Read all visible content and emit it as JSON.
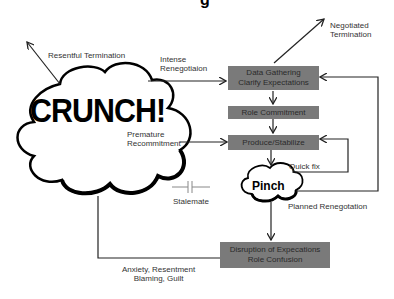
{
  "title_fragment": "g",
  "cloud_labels": {
    "crunch": "CRUNCH!",
    "pinch": "Pinch"
  },
  "boxes": [
    {
      "id": "data-gathering",
      "lines": [
        "Data Gathering",
        "Clarify Expectations"
      ]
    },
    {
      "id": "role-commitment",
      "lines": [
        "Role Commitment"
      ]
    },
    {
      "id": "produce-stabilize",
      "lines": [
        "Produce/Stabilize"
      ]
    },
    {
      "id": "disruption",
      "lines": [
        "Disruption of Expecations",
        "Role Confusion"
      ]
    }
  ],
  "edge_labels": {
    "resentful_termination": "Resentful Termination",
    "intense_renegotiation": [
      "Intense",
      "Renegotiaion"
    ],
    "negotiated_termination": [
      "Negotiated",
      "Termination"
    ],
    "premature_recommitment": [
      "Premature",
      "Recommitment"
    ],
    "quick_fix": "Quick fix",
    "stalemate": "Stalemate",
    "planned_renegotiation": "Planned Renegotation",
    "anxiety": [
      "Anxiety, Resentment",
      "Blaming, Guilt"
    ]
  },
  "colors": {
    "box_fill": "#7a7a7a",
    "line": "#222222"
  }
}
